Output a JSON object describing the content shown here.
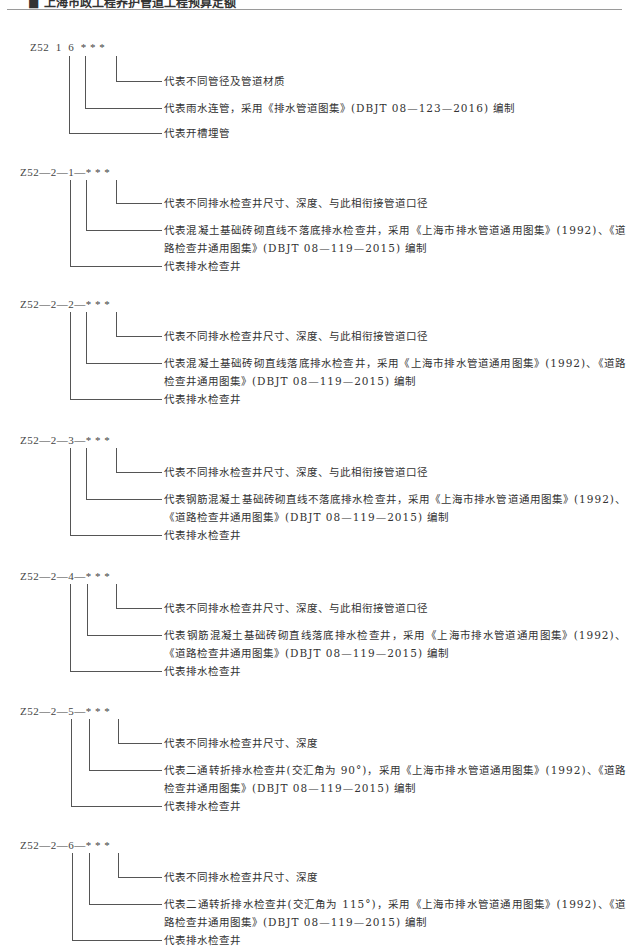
{
  "header": {
    "title": "■ 上海市政工程养护管道工程预算定额"
  },
  "blocks": [
    {
      "code": "Z52  1  6  * * *",
      "lines": [
        "代表不同管径及管道材质",
        "代表雨水连管，采用《排水管道图集》(DBJT 08—123—2016) 编制",
        "代表开槽埋管"
      ]
    },
    {
      "code": "Z52—2—1—* * *",
      "lines": [
        "代表不同排水检查井尺寸、深度、与此相衔接管道口径",
        "代表混凝土基础砖砌直线不落底排水检查井，采用《上海市排水管道通用图集》(1992)、《道路检查井通用图集》(DBJT 08—119—2015) 编制",
        "代表排水检查井"
      ]
    },
    {
      "code": "Z52—2—2—* * *",
      "lines": [
        "代表不同排水检查井尺寸、深度、与此相衔接管道口径",
        "代表混凝土基础砖砌直线落底排水检查井，采用《上海市排水管道通用图集》(1992)、《道路检查井通用图集》(DBJT 08—119—2015) 编制",
        "代表排水检查井"
      ]
    },
    {
      "code": "Z52—2—3—* * *",
      "lines": [
        "代表不同排水检查井尺寸、深度、与此相衔接管道口径",
        "代表钢筋混凝土基础砖砌直线不落底排水检查井，采用《上海市排水管道通用图集》(1992)、《道路检查井通用图集》(DBJT 08—119—2015) 编制",
        "代表排水检查井"
      ]
    },
    {
      "code": "Z52—2—4—* * *",
      "lines": [
        "代表不同排水检查井尺寸、深度、与此相衔接管道口径",
        "代表钢筋混凝土基础砖砌直线落底排水检查井，采用《上海市排水管道通用图集》(1992)、《道路检查井通用图集》(DBJT 08—119—2015) 编制",
        "代表排水检查井"
      ]
    },
    {
      "code": "Z52—2—5—* * *",
      "lines": [
        "代表不同排水检查井尺寸、深度",
        "代表二通转折排水检查井(交汇角为 90°)，采用《上海市排水管道通用图集》(1992)、《道路检查井通用图集》(DBJT 08—119—2015) 编制",
        "代表排水检查井"
      ]
    },
    {
      "code": "Z52—2—6—* * *",
      "lines": [
        "代表不同排水检查井尺寸、深度",
        "代表二通转折排水检查井(交汇角为 115°)，采用《上海市排水管道通用图集》(1992)、《道路检查井通用图集》(DBJT 08—119—2015) 编制",
        "代表排水检查井"
      ]
    }
  ]
}
